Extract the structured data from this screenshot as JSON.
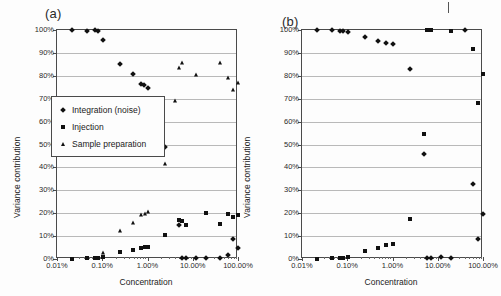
{
  "figure": {
    "background": "#fdfdfd",
    "marker_color": "#111111",
    "gridline_color": "#b9b9b9",
    "axis_color": "#4a4a4a"
  },
  "panels": [
    {
      "id": "a",
      "label": "(a)",
      "ylabel": "Variance contribution",
      "xlabel": "Concentration",
      "has_legend": true
    },
    {
      "id": "b",
      "label": "(b)",
      "ylabel": "Variance contribution",
      "xlabel": "Concentration",
      "has_legend": false
    }
  ],
  "legend": {
    "items": [
      {
        "marker": "diamond",
        "label": "Integration (noise)"
      },
      {
        "marker": "square",
        "label": "Injection"
      },
      {
        "marker": "triangle",
        "label": "Sample preparation"
      }
    ]
  },
  "axes": {
    "y_ticks": [
      "0%",
      "10%",
      "20%",
      "30%",
      "40%",
      "50%",
      "60%",
      "70%",
      "80%",
      "90%",
      "100%"
    ],
    "y_values": [
      0,
      10,
      20,
      30,
      40,
      50,
      60,
      70,
      80,
      90,
      100
    ],
    "x_ticks": [
      "0.01%",
      "0.10%",
      "1.00%",
      "10.00%",
      "100.00%"
    ],
    "x_values": [
      0.01,
      0.1,
      1,
      10,
      100
    ]
  },
  "chart_data": [
    {
      "type": "scatter",
      "panel": "(a)",
      "title": "(a)",
      "xlabel": "Concentration",
      "ylabel": "Variance contribution",
      "xscale": "log",
      "xlim": [
        0.01,
        100
      ],
      "ylim": [
        0,
        100
      ],
      "grid": true,
      "legend_position": "inside-left-middle",
      "series": [
        {
          "name": "Integration (noise)",
          "marker": "diamond",
          "points": [
            [
              0.022,
              100.0
            ],
            [
              0.047,
              99.6
            ],
            [
              0.068,
              99.8
            ],
            [
              0.082,
              99.7
            ],
            [
              0.105,
              95.8
            ],
            [
              0.25,
              85.0
            ],
            [
              0.47,
              80.6
            ],
            [
              0.72,
              76.5
            ],
            [
              0.85,
              75.8
            ],
            [
              1.0,
              74.6
            ],
            [
              2.4,
              48.8
            ],
            [
              5.0,
              14.8
            ],
            [
              5.8,
              0.4
            ],
            [
              7.0,
              0.4
            ],
            [
              12.0,
              0.4
            ],
            [
              20.0,
              0.4
            ],
            [
              40.0,
              0.3
            ],
            [
              60.0,
              1.9
            ],
            [
              78.0,
              8.9
            ],
            [
              100.0,
              4.9
            ]
          ]
        },
        {
          "name": "Injection",
          "marker": "square",
          "points": [
            [
              0.022,
              0.2
            ],
            [
              0.047,
              0.3
            ],
            [
              0.068,
              0.4
            ],
            [
              0.082,
              0.5
            ],
            [
              0.105,
              0.9
            ],
            [
              0.25,
              3.0
            ],
            [
              0.47,
              4.0
            ],
            [
              0.72,
              5.0
            ],
            [
              0.9,
              5.2
            ],
            [
              1.0,
              5.3
            ],
            [
              2.4,
              10.4
            ],
            [
              5.0,
              17.0
            ],
            [
              5.8,
              16.8
            ],
            [
              7.0,
              14.8
            ],
            [
              20.0,
              20.0
            ],
            [
              40.0,
              15.2
            ],
            [
              60.0,
              19.5
            ],
            [
              78.0,
              18.4
            ],
            [
              100.0,
              19.0
            ]
          ]
        },
        {
          "name": "Sample preparation",
          "marker": "triangle",
          "points": [
            [
              0.105,
              2.6
            ],
            [
              0.25,
              12.1
            ],
            [
              0.47,
              15.8
            ],
            [
              0.72,
              19.2
            ],
            [
              0.9,
              19.6
            ],
            [
              1.0,
              20.4
            ],
            [
              2.4,
              41.3
            ],
            [
              4.0,
              69.1
            ],
            [
              5.0,
              83.3
            ],
            [
              5.8,
              85.6
            ],
            [
              12.0,
              80.5
            ],
            [
              40.0,
              85.4
            ],
            [
              60.0,
              79.2
            ],
            [
              78.0,
              73.8
            ],
            [
              100.0,
              76.8
            ]
          ]
        }
      ]
    },
    {
      "type": "scatter",
      "panel": "(b)",
      "title": "(b)",
      "xlabel": "Concentration",
      "ylabel": "Variance contribution",
      "xscale": "log",
      "xlim": [
        0.01,
        100
      ],
      "ylim": [
        0,
        100
      ],
      "grid": true,
      "legend_position": "none",
      "series": [
        {
          "name": "Integration (noise)",
          "marker": "diamond",
          "points": [
            [
              0.022,
              99.9
            ],
            [
              0.047,
              99.8
            ],
            [
              0.068,
              99.7
            ],
            [
              0.082,
              99.6
            ],
            [
              0.105,
              99.2
            ],
            [
              0.25,
              96.8
            ],
            [
              0.47,
              95.4
            ],
            [
              0.72,
              94.2
            ],
            [
              1.0,
              94.0
            ],
            [
              2.4,
              83.0
            ],
            [
              5.0,
              45.9
            ],
            [
              5.8,
              0.4
            ],
            [
              7.0,
              0.4
            ],
            [
              12.0,
              0.9
            ],
            [
              20.0,
              0.3
            ],
            [
              40.0,
              99.9
            ],
            [
              60.0,
              32.6
            ],
            [
              78.0,
              8.9
            ],
            [
              100.0,
              19.8
            ]
          ]
        },
        {
          "name": "Injection",
          "marker": "square",
          "points": [
            [
              0.022,
              0.2
            ],
            [
              0.047,
              0.3
            ],
            [
              0.068,
              0.4
            ],
            [
              0.082,
              0.5
            ],
            [
              0.105,
              0.9
            ],
            [
              0.25,
              3.6
            ],
            [
              0.47,
              4.9
            ],
            [
              0.72,
              6.1
            ],
            [
              1.0,
              6.4
            ],
            [
              2.4,
              17.5
            ],
            [
              5.0,
              54.5
            ],
            [
              5.8,
              100.0
            ],
            [
              7.0,
              100.0
            ],
            [
              20.0,
              99.5
            ],
            [
              60.0,
              91.8
            ],
            [
              78.0,
              68.2
            ],
            [
              100.0,
              80.7
            ]
          ]
        }
      ]
    }
  ]
}
